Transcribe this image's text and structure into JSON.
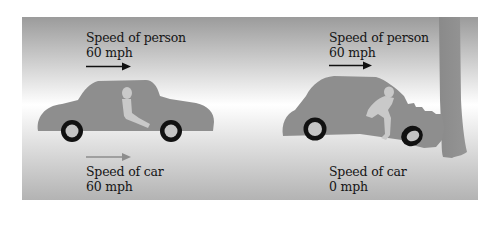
{
  "diagram": {
    "colors": {
      "background_top": "#9b9b9b",
      "background_mid": "#ffffff",
      "background_bottom": "#b3b3b3",
      "car_body": "#8e8e8e",
      "tree": "#8a8a8a",
      "person": "#c9c9c9",
      "tire": "#111111",
      "hubcap": "#c4c4c4",
      "person_arrow": "#111111",
      "car_arrow": "#8d8d8d"
    },
    "panels": [
      {
        "id": "before-impact",
        "person_speed": {
          "title": "Speed  of person",
          "value": "60 mph"
        },
        "car_speed": {
          "title": "Speed  of car",
          "value": "60 mph"
        }
      },
      {
        "id": "after-impact",
        "person_speed": {
          "title": "Speed  of person",
          "value": "60 mph"
        },
        "car_speed": {
          "title": "Speed  of car",
          "value": "0 mph"
        }
      }
    ]
  }
}
